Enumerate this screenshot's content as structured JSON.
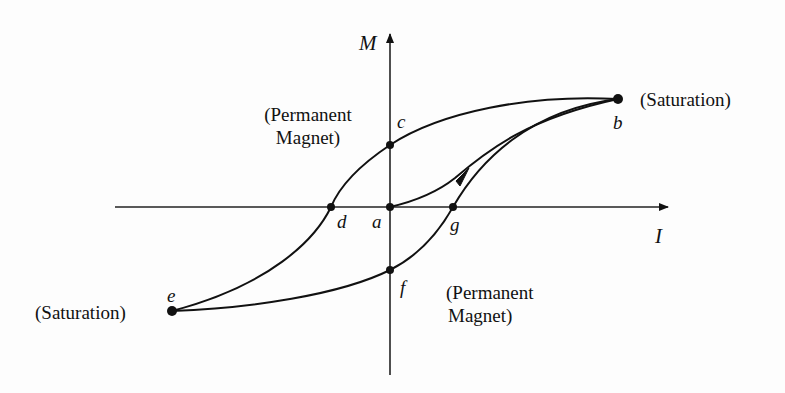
{
  "diagram": {
    "type": "hysteresis-loop",
    "axes": {
      "vertical_label": "M",
      "horizontal_label": "I"
    },
    "points": {
      "a": "a",
      "b": "b",
      "c": "c",
      "d": "d",
      "e": "e",
      "f": "f",
      "g": "g"
    },
    "annotations": {
      "saturation_right": "(Saturation)",
      "saturation_left": "(Saturation)",
      "permanent_top_line1": "(Permanent",
      "permanent_top_line2": "Magnet)",
      "permanent_bottom_line1": "(Permanent",
      "permanent_bottom_line2": "Magnet)"
    },
    "colors": {
      "stroke": "#111111",
      "background": "#fdfdfd"
    }
  }
}
